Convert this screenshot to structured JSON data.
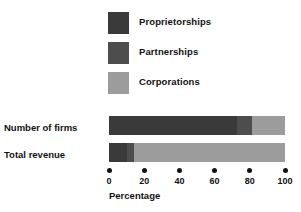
{
  "chart_data": {
    "type": "bar",
    "orientation": "horizontal",
    "stacked": true,
    "title": "",
    "subtitle": "",
    "xlabel": "Percentage",
    "ylabel": "",
    "categories": [
      "Number of firms",
      "Total revenue"
    ],
    "series": [
      {
        "name": "Proprietorships",
        "color": "#3a3a3a",
        "values": [
          73,
          10
        ]
      },
      {
        "name": "Partnerships",
        "color": "#4d4d4d",
        "values": [
          8,
          4
        ]
      },
      {
        "name": "Corporations",
        "color": "#9c9c9c",
        "values": [
          19,
          86
        ]
      }
    ],
    "xlim": [
      0,
      100
    ],
    "xticks": [
      0,
      20,
      40,
      60,
      80,
      100
    ],
    "xtick_labels": [
      "0",
      "20",
      "40",
      "60",
      "80",
      "100"
    ],
    "grid": false,
    "legend_position": "top-center",
    "background": "#ffffff",
    "text_color": "#111111"
  },
  "legend": {
    "items": [
      {
        "label": "Proprietorships",
        "swatch_color": "#3a3a3a"
      },
      {
        "label": "Partnerships",
        "swatch_color": "#4d4d4d"
      },
      {
        "label": "Corporations",
        "swatch_color": "#9c9c9c"
      }
    ]
  },
  "rows": [
    {
      "label": "Number of firms",
      "segments": [
        73,
        8,
        19
      ]
    },
    {
      "label": "Total revenue",
      "segments": [
        10,
        4,
        86
      ]
    }
  ],
  "axis": {
    "title": "Percentage",
    "ticks": [
      "0",
      "20",
      "40",
      "60",
      "80",
      "100"
    ]
  }
}
